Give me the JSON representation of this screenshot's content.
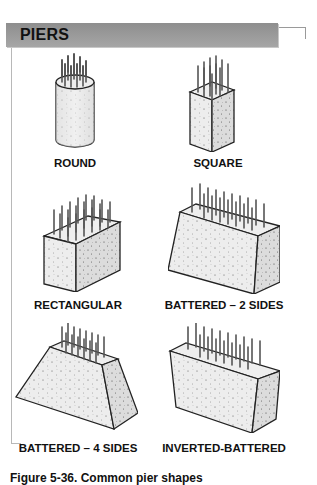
{
  "header": {
    "title": "PIERS"
  },
  "piers": [
    {
      "id": "round",
      "label": "ROUND"
    },
    {
      "id": "square",
      "label": "SQUARE"
    },
    {
      "id": "rectangular",
      "label": "RECTANGULAR"
    },
    {
      "id": "battered-2",
      "label": "BATTERED – 2 SIDES"
    },
    {
      "id": "battered-4",
      "label": "BATTERED – 4 SIDES"
    },
    {
      "id": "inverted-battered",
      "label": "INVERTED-BATTERED"
    }
  ],
  "caption": "Figure 5-36. Common pier shapes"
}
